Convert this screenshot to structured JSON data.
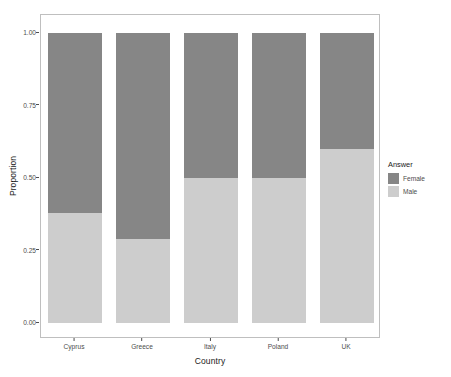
{
  "chart_data": {
    "type": "bar",
    "subtype": "stacked-100-percent",
    "title": "",
    "xlabel": "Country",
    "ylabel": "Proportion",
    "categories": [
      "Cyprus",
      "Greece",
      "Italy",
      "Poland",
      "UK"
    ],
    "series": [
      {
        "name": "Female",
        "color": "#868686",
        "values": [
          0.62,
          0.71,
          0.5,
          0.5,
          0.4
        ]
      },
      {
        "name": "Male",
        "color": "#cdcdcd",
        "values": [
          0.38,
          0.29,
          0.5,
          0.5,
          0.6
        ]
      }
    ],
    "stack_order_bottom_to_top": [
      "Male",
      "Female"
    ],
    "ylim": [
      0,
      1
    ],
    "yticks": [
      0.0,
      0.25,
      0.5,
      0.75,
      1.0
    ],
    "ytick_labels": [
      "0.00",
      "0.25",
      "0.50",
      "0.75",
      "1.00"
    ],
    "grid": false,
    "legend_title": "Answer",
    "legend_position": "right",
    "panel_background": "#ffffff",
    "panel_border_color": "#bfbfbf",
    "axis_text_color": "#4d4d4d"
  },
  "axes": {
    "y": {
      "title": "Proportion",
      "ticks": [
        {
          "label": "1.00",
          "value": 1.0
        },
        {
          "label": "0.75",
          "value": 0.75
        },
        {
          "label": "0.50",
          "value": 0.5
        },
        {
          "label": "0.25",
          "value": 0.25
        },
        {
          "label": "0.00",
          "value": 0.0
        }
      ]
    },
    "x": {
      "title": "Country",
      "ticks": [
        {
          "label": "Cyprus"
        },
        {
          "label": "Greece"
        },
        {
          "label": "Italy"
        },
        {
          "label": "Poland"
        },
        {
          "label": "UK"
        }
      ]
    }
  },
  "legend": {
    "title": "Answer",
    "items": [
      {
        "label": "Female",
        "color": "#868686"
      },
      {
        "label": "Male",
        "color": "#cdcdcd"
      }
    ]
  }
}
